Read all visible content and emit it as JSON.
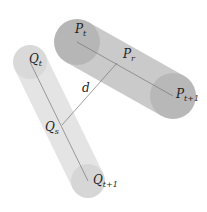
{
  "diagram": {
    "colors": {
      "background": "#ffffff",
      "capsule_p_body": "#c9c9c9",
      "capsule_p_end": "#b4b4b4",
      "capsule_q_body": "#e4e4e4",
      "capsule_q_end": "#d8d8d8",
      "line": "#666666",
      "text": "#222222"
    },
    "capsule_p": {
      "start": {
        "x": 77,
        "y": 42,
        "r": 23,
        "label": "P",
        "sub": "t"
      },
      "end": {
        "x": 173,
        "y": 96,
        "r": 23,
        "label": "P",
        "sub": "t+1"
      },
      "mid_label": {
        "label": "P",
        "sub": "r"
      }
    },
    "capsule_q": {
      "start": {
        "x": 30,
        "y": 62,
        "r": 17,
        "label": "Q",
        "sub": "t"
      },
      "end": {
        "x": 88,
        "y": 181,
        "r": 17,
        "label": "Q",
        "sub": "t+1"
      },
      "mid_label": {
        "label": "Q",
        "sub": "s"
      }
    },
    "distance": {
      "label": "d",
      "from": {
        "x": 62,
        "y": 125
      },
      "to": {
        "x": 117,
        "y": 63
      }
    }
  }
}
